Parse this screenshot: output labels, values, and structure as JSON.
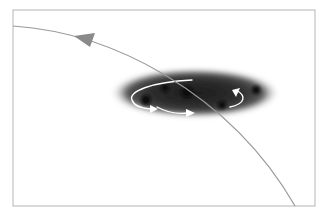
{
  "diagram": {
    "frame": {
      "x": 13,
      "y": 10,
      "width": 302,
      "height": 196,
      "stroke": "#b5b5b5"
    },
    "trajectory": {
      "path": "M13,26 C70,30 120,48 165,75 C215,105 260,145 295,206",
      "stroke": "#9a9a9a",
      "arrowhead": {
        "points": "74,36 95,33 90,47",
        "fill": "#8a8a8a",
        "direction": "toward upper-left"
      }
    },
    "cloud": {
      "cx": 195,
      "cy": 93,
      "rx": 85,
      "ry": 25,
      "color_core": "#1e1e1e",
      "color_edge": "#7a7a7a",
      "dense_spots": [
        {
          "cx": 146,
          "cy": 100,
          "r": 5
        },
        {
          "cx": 187,
          "cy": 92,
          "r": 6
        },
        {
          "cx": 222,
          "cy": 105,
          "r": 4
        },
        {
          "cx": 256,
          "cy": 90,
          "r": 4
        },
        {
          "cx": 165,
          "cy": 88,
          "r": 4
        }
      ]
    },
    "rotation_arrows": {
      "color": "#ffffff",
      "items": [
        {
          "name": "rotation-arrow-left-loop",
          "path": "M192,80 C150,82 128,92 132,100 C134,106 140,108 150,109",
          "head": "150,105 158,109 150,113"
        },
        {
          "name": "rotation-arrow-bottom",
          "path": "M157,107 C168,113 180,114 188,113",
          "head": "186,109 195,113 186,117"
        },
        {
          "name": "rotation-arrow-right-loop",
          "path": "M230,107 C245,104 247,96 236,90",
          "head": "240,88 232,90 236,97"
        }
      ]
    }
  }
}
